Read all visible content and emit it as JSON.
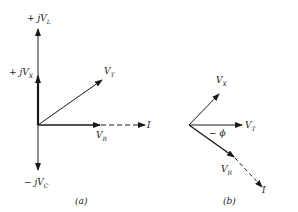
{
  "diagram_a": {
    "caption": "(a)",
    "labels": {
      "vl": {
        "prefix": "+ j",
        "main": "V",
        "sub": "L"
      },
      "vx": {
        "prefix": "+ j",
        "main": "V",
        "sub": "X"
      },
      "vt": {
        "prefix": "",
        "main": "V",
        "sub": "T"
      },
      "vr": {
        "prefix": "",
        "main": "V",
        "sub": "R"
      },
      "i": {
        "main": "I"
      },
      "vc": {
        "prefix": "− j",
        "main": "V",
        "sub": "C"
      }
    }
  },
  "diagram_b": {
    "caption": "(b)",
    "labels": {
      "vx": {
        "main": "V",
        "sub": "X"
      },
      "vt": {
        "main": "V",
        "sub": "T"
      },
      "vr": {
        "main": "V",
        "sub": "R"
      },
      "i": {
        "main": "I"
      },
      "phi": "− ϕ"
    }
  }
}
